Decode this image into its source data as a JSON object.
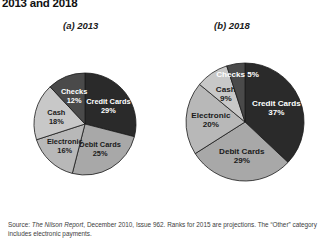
{
  "title": "2013 and 2018",
  "captions": {
    "a": "(a) 2013",
    "b": "(b) 2018"
  },
  "source": {
    "prefix": "Source: ",
    "publication": "The Nilson Report",
    "rest": ", December 2010, Issue 962. Ranks for 2015 are projections. The “Other” category includes electronic payments."
  },
  "colors": {
    "credit_cards": "#2a2a2a",
    "checks": "#4a4a4a",
    "debit_cards": "#a8a8a8",
    "electronic": "#b8b8b8",
    "cash": "#c8c8c8",
    "slice_stroke": "#1a1a1a",
    "text_dark": "#1a1a1a",
    "text_light": "#ffffff",
    "source_text": "#3d3d3d"
  },
  "chart_data": [
    {
      "type": "pie",
      "title": "(a) 2013",
      "id": "pie-2013",
      "categories": [
        "Credit Cards",
        "Debit Cards",
        "Electronic",
        "Cash",
        "Checks"
      ],
      "values": [
        29,
        25,
        16,
        18,
        12
      ],
      "unit": "%",
      "legend": "none (labels drawn inside slices)",
      "labels": [
        {
          "name": "Credit Cards",
          "value": 29,
          "text": "Credit Cards",
          "value_text": "29%",
          "color": "#2a2a2a",
          "label_color": "#ffffff"
        },
        {
          "name": "Debit Cards",
          "value": 25,
          "text": "Debit Cards",
          "value_text": "25%",
          "color": "#a8a8a8",
          "label_color": "#1a1a1a"
        },
        {
          "name": "Electronic",
          "value": 16,
          "text": "Electronic",
          "value_text": "16%",
          "color": "#b8b8b8",
          "label_color": "#1a1a1a"
        },
        {
          "name": "Cash",
          "value": 18,
          "text": "Cash",
          "value_text": "18%",
          "color": "#c8c8c8",
          "label_color": "#1a1a1a"
        },
        {
          "name": "Checks",
          "value": 12,
          "text": "Checks",
          "value_text": "12%",
          "color": "#4a4a4a",
          "label_color": "#ffffff"
        }
      ]
    },
    {
      "type": "pie",
      "title": "(b) 2018",
      "id": "pie-2018",
      "categories": [
        "Credit Cards",
        "Debit Cards",
        "Electronic",
        "Cash",
        "Checks"
      ],
      "values": [
        37,
        29,
        20,
        9,
        5
      ],
      "unit": "%",
      "legend": "none (labels drawn inside slices)",
      "labels": [
        {
          "name": "Credit Cards",
          "value": 37,
          "text": "Credit Cards",
          "value_text": "37%",
          "color": "#2a2a2a",
          "label_color": "#ffffff"
        },
        {
          "name": "Debit Cards",
          "value": 29,
          "text": "Debit Cards",
          "value_text": "29%",
          "color": "#a8a8a8",
          "label_color": "#1a1a1a"
        },
        {
          "name": "Electronic",
          "value": 20,
          "text": "Electronic",
          "value_text": "20%",
          "color": "#b8b8b8",
          "label_color": "#1a1a1a"
        },
        {
          "name": "Cash",
          "value": 9,
          "text": "Cash",
          "value_text": "9%",
          "color": "#c8c8c8",
          "label_color": "#1a1a1a"
        },
        {
          "name": "Checks",
          "value": 5,
          "text": "Checks 5%",
          "value_text": "",
          "color": "#4a4a4a",
          "label_color": "#ffffff"
        }
      ]
    }
  ]
}
